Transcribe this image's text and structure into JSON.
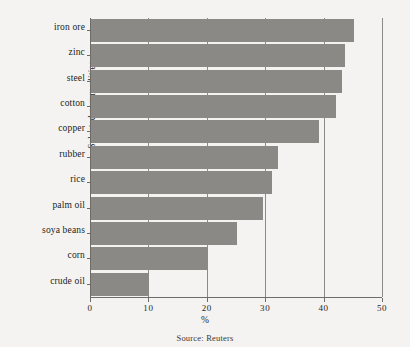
{
  "chart_data": {
    "type": "bar",
    "orientation": "horizontal",
    "title": "",
    "xlabel": "%",
    "ylabel": "Selected commodities",
    "xlim": [
      0,
      50
    ],
    "xticks": [
      0,
      10,
      20,
      30,
      40,
      50
    ],
    "xtick_labels": [
      "0",
      "10",
      "20",
      "30",
      "40",
      "50"
    ],
    "grid": true,
    "grid_axis": "x",
    "legend": false,
    "categories": [
      "iron ore",
      "zinc",
      "steel",
      "cotton",
      "copper",
      "rubber",
      "rice",
      "palm oil",
      "soya beans",
      "corn",
      "crude oil"
    ],
    "values": [
      45.0,
      43.5,
      43.0,
      42.0,
      39.0,
      32.0,
      31.0,
      29.5,
      25.0,
      20.0,
      10.0
    ],
    "bar_color": "#8b8986",
    "axis_color": "#6f6c68",
    "background_color": "#f4f3f1"
  },
  "caption": {
    "source": "Source: Reuters"
  }
}
